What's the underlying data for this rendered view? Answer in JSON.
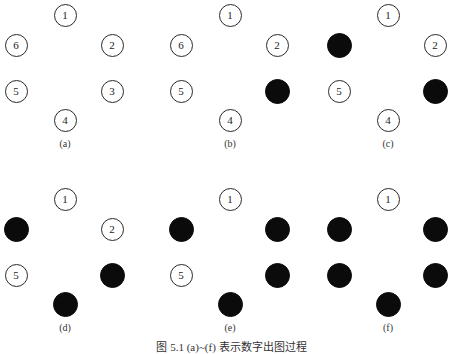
{
  "figure": {
    "caption": "图 5.1  (a)~(f) 表示数字出图过程",
    "caption_note": "caption partially clipped at bottom edge"
  },
  "layout": {
    "node_positions": {
      "1": [
        65,
        15
      ],
      "6": [
        16,
        45
      ],
      "2": [
        112,
        45
      ],
      "5": [
        16,
        91
      ],
      "3": [
        112,
        91
      ],
      "4": [
        65,
        120
      ]
    },
    "label_position": [
      65,
      145
    ]
  },
  "panels": [
    {
      "id": "a",
      "label": "(a)",
      "offset": [
        0,
        0
      ],
      "nodes": [
        {
          "id": "1",
          "text": "1",
          "filled": false
        },
        {
          "id": "6",
          "text": "6",
          "filled": false
        },
        {
          "id": "2",
          "text": "2",
          "filled": false
        },
        {
          "id": "5",
          "text": "5",
          "filled": false
        },
        {
          "id": "3",
          "text": "3",
          "filled": false
        },
        {
          "id": "4",
          "text": "4",
          "filled": false
        }
      ]
    },
    {
      "id": "b",
      "label": "(b)",
      "offset": [
        165,
        0
      ],
      "nodes": [
        {
          "id": "1",
          "text": "1",
          "filled": false
        },
        {
          "id": "6",
          "text": "6",
          "filled": false
        },
        {
          "id": "2",
          "text": "2",
          "filled": false
        },
        {
          "id": "5",
          "text": "5",
          "filled": false
        },
        {
          "id": "3",
          "text": "",
          "filled": true
        },
        {
          "id": "4",
          "text": "4",
          "filled": false
        }
      ]
    },
    {
      "id": "c",
      "label": "(c)",
      "offset": [
        323,
        0
      ],
      "nodes": [
        {
          "id": "1",
          "text": "1",
          "filled": false
        },
        {
          "id": "6",
          "text": "",
          "filled": true
        },
        {
          "id": "2",
          "text": "2",
          "filled": false
        },
        {
          "id": "5",
          "text": "5",
          "filled": false
        },
        {
          "id": "3",
          "text": "",
          "filled": true
        },
        {
          "id": "4",
          "text": "4",
          "filled": false
        }
      ]
    },
    {
      "id": "d",
      "label": "(d)",
      "offset": [
        0,
        184
      ],
      "nodes": [
        {
          "id": "1",
          "text": "1",
          "filled": false
        },
        {
          "id": "6",
          "text": "",
          "filled": true
        },
        {
          "id": "2",
          "text": "2",
          "filled": false
        },
        {
          "id": "5",
          "text": "5",
          "filled": false
        },
        {
          "id": "3",
          "text": "",
          "filled": true
        },
        {
          "id": "4",
          "text": "",
          "filled": true
        }
      ]
    },
    {
      "id": "e",
      "label": "(e)",
      "offset": [
        165,
        184
      ],
      "nodes": [
        {
          "id": "1",
          "text": "1",
          "filled": false
        },
        {
          "id": "6",
          "text": "",
          "filled": true
        },
        {
          "id": "2",
          "text": "",
          "filled": true
        },
        {
          "id": "5",
          "text": "5",
          "filled": false
        },
        {
          "id": "3",
          "text": "",
          "filled": true
        },
        {
          "id": "4",
          "text": "",
          "filled": true
        }
      ]
    },
    {
      "id": "f",
      "label": "(f)",
      "offset": [
        323,
        184
      ],
      "nodes": [
        {
          "id": "1",
          "text": "1",
          "filled": false
        },
        {
          "id": "6",
          "text": "",
          "filled": true
        },
        {
          "id": "2",
          "text": "",
          "filled": true
        },
        {
          "id": "5",
          "text": "",
          "filled": true
        },
        {
          "id": "3",
          "text": "",
          "filled": true
        },
        {
          "id": "4",
          "text": "",
          "filled": true
        }
      ]
    }
  ]
}
